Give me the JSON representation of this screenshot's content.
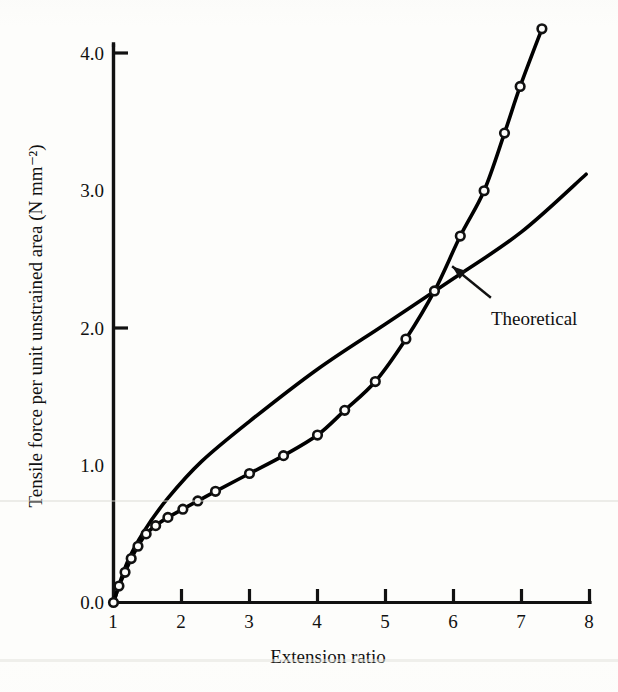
{
  "chart_data": {
    "type": "line",
    "title": "",
    "xlabel": "Extension ratio",
    "ylabel": "Tensile force per unit unstrained area (N mm⁻²)",
    "xlim": [
      1,
      8
    ],
    "ylim": [
      0.0,
      4.0
    ],
    "xticks": [
      1,
      2,
      3,
      4,
      5,
      6,
      7,
      8
    ],
    "yticks": [
      0.0,
      1.0,
      2.0,
      3.0,
      4.0
    ],
    "xtick_labels": [
      "1",
      "2",
      "3",
      "4",
      "5",
      "6",
      "7",
      "8"
    ],
    "ytick_labels": [
      "0.0",
      "1.0",
      "2.0",
      "3.0",
      "4.0"
    ],
    "grid": false,
    "legend": "none",
    "series": [
      {
        "name": "Experimental",
        "marker": "open-circle",
        "line_style": "solid",
        "color": "#000000",
        "points": [
          {
            "x": 1.0,
            "y": 0.0
          },
          {
            "x": 1.08,
            "y": 0.12
          },
          {
            "x": 1.17,
            "y": 0.22
          },
          {
            "x": 1.26,
            "y": 0.32
          },
          {
            "x": 1.36,
            "y": 0.41
          },
          {
            "x": 1.48,
            "y": 0.5
          },
          {
            "x": 1.62,
            "y": 0.56
          },
          {
            "x": 1.8,
            "y": 0.62
          },
          {
            "x": 2.02,
            "y": 0.68
          },
          {
            "x": 2.24,
            "y": 0.74
          },
          {
            "x": 2.5,
            "y": 0.81
          },
          {
            "x": 3.0,
            "y": 0.94
          },
          {
            "x": 3.5,
            "y": 1.07
          },
          {
            "x": 4.0,
            "y": 1.22
          },
          {
            "x": 4.4,
            "y": 1.4
          },
          {
            "x": 4.85,
            "y": 1.61
          },
          {
            "x": 5.3,
            "y": 1.92
          },
          {
            "x": 5.72,
            "y": 2.27
          },
          {
            "x": 6.1,
            "y": 2.67
          },
          {
            "x": 6.45,
            "y": 3.0
          },
          {
            "x": 6.75,
            "y": 3.42
          },
          {
            "x": 6.98,
            "y": 3.76
          },
          {
            "x": 7.3,
            "y": 4.18
          }
        ]
      },
      {
        "name": "Theoretical",
        "marker": "none",
        "line_style": "solid",
        "color": "#000000",
        "points": [
          {
            "x": 1.0,
            "y": 0.0
          },
          {
            "x": 1.2,
            "y": 0.29
          },
          {
            "x": 1.45,
            "y": 0.52
          },
          {
            "x": 1.8,
            "y": 0.76
          },
          {
            "x": 2.3,
            "y": 1.03
          },
          {
            "x": 3.0,
            "y": 1.32
          },
          {
            "x": 4.0,
            "y": 1.7
          },
          {
            "x": 5.0,
            "y": 2.03
          },
          {
            "x": 6.0,
            "y": 2.36
          },
          {
            "x": 7.0,
            "y": 2.7
          },
          {
            "x": 7.95,
            "y": 3.12
          }
        ]
      }
    ],
    "annotations": [
      {
        "text": "Theoretical",
        "label_x": 6.55,
        "label_y": 2.15,
        "arrow_from_x": 6.55,
        "arrow_from_y": 2.22,
        "arrow_to_x": 5.98,
        "arrow_to_y": 2.45
      }
    ]
  }
}
